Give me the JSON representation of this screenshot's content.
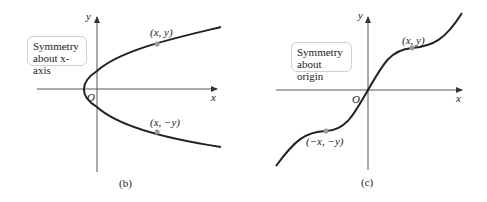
{
  "panels": [
    {
      "id": "b",
      "caption": "(b)",
      "box_line1": "Symmetry",
      "box_line2": "about x-axis",
      "axis_x": "x",
      "axis_y": "y",
      "origin": "O",
      "point_upper": "(x, y)",
      "point_lower": "(x, −y)"
    },
    {
      "id": "c",
      "caption": "(c)",
      "box_line1": "Symmetry",
      "box_line2": "about origin",
      "axis_x": "x",
      "axis_y": "y",
      "origin": "O",
      "point_upper": "(x, y)",
      "point_lower": "(−x, −y)"
    }
  ],
  "colors": {
    "curve": "#222222",
    "axis": "#555555",
    "point": "#999999",
    "box_border": "#cfcfcf"
  }
}
